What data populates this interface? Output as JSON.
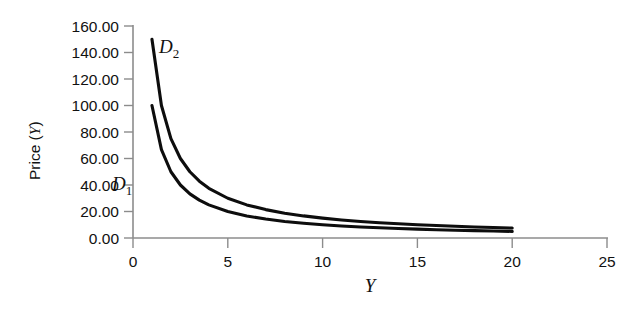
{
  "chart_data": {
    "type": "line",
    "title": "",
    "xlabel": "Y",
    "ylabel": "Price (Y)",
    "ylabel_text": "Price (",
    "ylabel_var": "Y",
    "ylabel_close": ")",
    "xlim": [
      0,
      25
    ],
    "ylim": [
      0,
      160
    ],
    "grid": false,
    "legend": "inline-labels",
    "x_ticks": [
      "0",
      "5",
      "10",
      "15",
      "20",
      "25"
    ],
    "x_tick_values": [
      0,
      5,
      10,
      15,
      20,
      25
    ],
    "y_ticks": [
      "0.00",
      "20.00",
      "40.00",
      "60.00",
      "80.00",
      "100.00",
      "120.00",
      "140.00",
      "160.00"
    ],
    "y_tick_values": [
      0,
      20,
      40,
      60,
      80,
      100,
      120,
      140,
      160
    ],
    "series": [
      {
        "name": "D1",
        "label_main": "D",
        "label_sub": "1",
        "formula": "100 / Y",
        "x": [
          1,
          1.5,
          2,
          2.5,
          3,
          3.5,
          4,
          5,
          6,
          7,
          8,
          9,
          10,
          11,
          12,
          13,
          14,
          15,
          16,
          17,
          18,
          19,
          20
        ],
        "values": [
          100.0,
          66.67,
          50.0,
          40.0,
          33.33,
          28.57,
          25.0,
          20.0,
          16.67,
          14.29,
          12.5,
          11.11,
          10.0,
          9.09,
          8.33,
          7.69,
          7.14,
          6.67,
          6.25,
          5.88,
          5.56,
          5.26,
          5.0
        ]
      },
      {
        "name": "D2",
        "label_main": "D",
        "label_sub": "2",
        "formula": "150 / Y",
        "x": [
          1,
          1.5,
          2,
          2.5,
          3,
          3.5,
          4,
          5,
          6,
          7,
          8,
          9,
          10,
          11,
          12,
          13,
          14,
          15,
          16,
          17,
          18,
          19,
          20
        ],
        "values": [
          150.0,
          100.0,
          75.0,
          60.0,
          50.0,
          42.86,
          37.5,
          30.0,
          25.0,
          21.43,
          18.75,
          16.67,
          15.0,
          13.64,
          12.5,
          11.54,
          10.71,
          10.0,
          9.38,
          8.82,
          8.33,
          7.89,
          7.5
        ]
      }
    ],
    "colors": {
      "curve": "#0d0d0d",
      "axis": "#8c8c8c",
      "text": "#111111",
      "background": "#ffffff"
    }
  }
}
